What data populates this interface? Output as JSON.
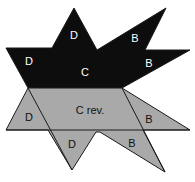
{
  "colors": {
    "top_fill": "#0d0d0d",
    "bottom_fill": "#a9a9a9",
    "stroke": "#1a1a1a",
    "background": "#ffffff"
  },
  "top_region": {
    "labels": [
      {
        "text": "D",
        "x": 74,
        "y": 35
      },
      {
        "text": "B",
        "x": 135,
        "y": 38
      },
      {
        "text": "D",
        "x": 29,
        "y": 61
      },
      {
        "text": "B",
        "x": 149,
        "y": 63
      },
      {
        "text": "C",
        "x": 85,
        "y": 72
      }
    ]
  },
  "bottom_region": {
    "labels": [
      {
        "text": "C rev.",
        "x": 90,
        "y": 110
      },
      {
        "text": "D",
        "x": 29,
        "y": 117
      },
      {
        "text": "B",
        "x": 149,
        "y": 119
      },
      {
        "text": "D",
        "x": 72,
        "y": 144
      },
      {
        "text": "B",
        "x": 132,
        "y": 143
      }
    ]
  }
}
